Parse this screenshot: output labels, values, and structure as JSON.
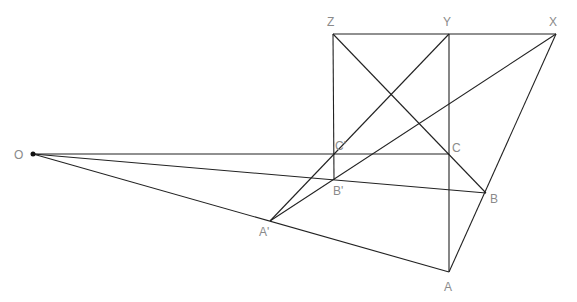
{
  "diagram": {
    "points": {
      "O": {
        "label": "O"
      },
      "A": {
        "label": "A"
      },
      "B": {
        "label": "B"
      },
      "C": {
        "label": "C"
      },
      "A1": {
        "label": "A'"
      },
      "B1": {
        "label": "B'"
      },
      "C1": {
        "label": "C'"
      },
      "X": {
        "label": "X"
      },
      "Y": {
        "label": "Y"
      },
      "Z": {
        "label": "Z"
      }
    },
    "segments": [
      [
        "Z",
        "X"
      ],
      [
        "Z",
        "B1"
      ],
      [
        "Y",
        "A"
      ],
      [
        "Z",
        "B"
      ],
      [
        "X",
        "A"
      ],
      [
        "Y",
        "A1"
      ],
      [
        "X",
        "A1"
      ],
      [
        "O",
        "A"
      ],
      [
        "O",
        "B"
      ],
      [
        "O",
        "C"
      ]
    ]
  }
}
